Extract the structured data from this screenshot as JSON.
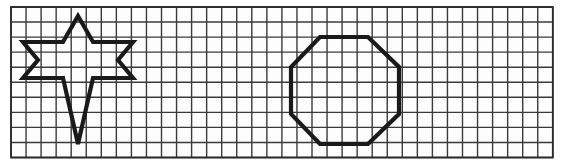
{
  "page": {
    "background_color": "#ffffff",
    "width": 564,
    "height": 166
  },
  "grid": {
    "name": "square-grid",
    "origin_x": 11,
    "origin_y": 7,
    "cell_size": 15.05,
    "columns": 36,
    "rows": 10,
    "line_color": "#3a3a3a",
    "line_width": 1.4,
    "border_color": "#2b2b2b",
    "border_width": 1.8,
    "faint_fill": "#fdfdfd"
  },
  "shapes": [
    {
      "name": "six-pointed-star",
      "label": "Six-pointed star",
      "stroke_color": "#1a1a1a",
      "stroke_width": 4.2,
      "closed": true,
      "points": [
        [
          78,
          16
        ],
        [
          93,
          42
        ],
        [
          133,
          42
        ],
        [
          118,
          60
        ],
        [
          133,
          78
        ],
        [
          93,
          78
        ],
        [
          78,
          144
        ],
        [
          63,
          78
        ],
        [
          23,
          78
        ],
        [
          38,
          60
        ],
        [
          23,
          42
        ],
        [
          63,
          42
        ]
      ],
      "points_note": "star outline traced clockwise from apex through alternating outer tips and inner notches"
    },
    {
      "name": "regular-octagon",
      "label": "Regular octagon",
      "stroke_color": "#1a1a1a",
      "stroke_width": 4.2,
      "closed": true,
      "points": [
        [
          320,
          37
        ],
        [
          368,
          37
        ],
        [
          399,
          67
        ],
        [
          399,
          114
        ],
        [
          368,
          144
        ],
        [
          320,
          144
        ],
        [
          291,
          114
        ],
        [
          291,
          67
        ]
      ]
    }
  ],
  "chart_data": {
    "type": "scatter",
    "xlabel": "",
    "ylabel": "",
    "grid": true,
    "xlim": [
      0,
      36
    ],
    "ylim": [
      0,
      10
    ],
    "legend_position": "none",
    "series": [
      {
        "name": "Six-pointed star",
        "closed_polygon": true,
        "x": [
          4.45,
          5.45,
          8.1,
          7.1,
          8.1,
          5.45,
          4.45,
          3.45,
          0.8,
          1.8,
          0.8,
          3.45
        ],
        "y": [
          9.4,
          7.65,
          7.65,
          6.45,
          5.25,
          5.25,
          0.9,
          5.25,
          5.25,
          6.45,
          7.65,
          7.65
        ]
      },
      {
        "name": "Regular octagon",
        "closed_polygon": true,
        "x": [
          20.5,
          23.7,
          25.8,
          25.8,
          23.7,
          20.5,
          18.6,
          18.6
        ],
        "y": [
          8.0,
          8.0,
          6.0,
          3.0,
          1.0,
          1.0,
          3.0,
          6.0
        ]
      }
    ]
  }
}
